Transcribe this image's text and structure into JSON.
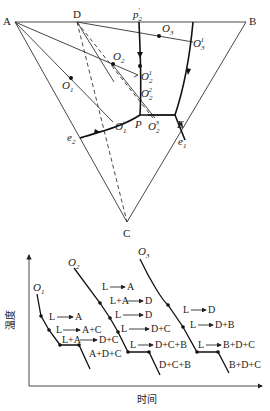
{
  "ternary": {
    "vertices": {
      "A": "A",
      "B": "B",
      "C": "C"
    },
    "points": {
      "D": "D",
      "P": "P",
      "E": "E",
      "e1": "e",
      "e1_sub": "1",
      "e2": "e",
      "e2_sub": "2",
      "O1": "O",
      "O1_sub": "1",
      "O2": "O",
      "O2_sub": "2",
      "O3": "O",
      "O3_sub": "3",
      "O1p": "O",
      "O1p_sub": "1",
      "O1p_sup": "′",
      "O2_1": "O",
      "O2_1_sub": "2",
      "O2_1_sup": "1",
      "O2_2": "O",
      "O2_2_sub": "2",
      "O2_2_sup": "2",
      "O2_3": "O",
      "O2_3_sub": "2",
      "O2_3_sup": "3",
      "O3_1": "O",
      "O3_1_sub": "3",
      "O3_1_sup": "1",
      "p2p": "p",
      "p2p_sub": "2",
      "p2p_sup": "′"
    }
  },
  "cooling": {
    "y_axis_label": "温度",
    "x_axis_label": "时间",
    "curves": [
      {
        "name": "O",
        "sub": "1",
        "labels": [
          "L",
          "A",
          "L",
          "A+C",
          "L+A",
          "D+C",
          "A+D+C"
        ]
      },
      {
        "name": "O",
        "sub": "2",
        "labels": [
          "L",
          "A",
          "L+A",
          "D",
          "L",
          "D",
          "L",
          "D+C",
          "L",
          "D+C+B",
          "D+C+B"
        ]
      },
      {
        "name": "O",
        "sub": "3",
        "labels": [
          "L",
          "D",
          "L",
          "D+B",
          "L",
          "B+D+C",
          "B+D+C"
        ]
      }
    ]
  }
}
